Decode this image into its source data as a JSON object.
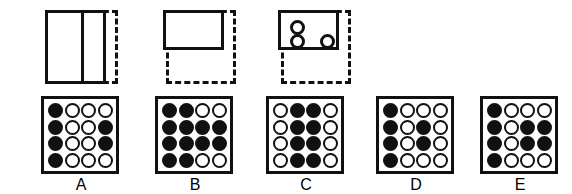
{
  "puzzle": {
    "type": "visual-analogy-matrix",
    "stimulus_count": 3,
    "option_count": 5
  },
  "stimuli": [
    {
      "id": "figure-1",
      "name": "divided-rectangle-with-dashed-frame",
      "description": "Tall solid rectangle split by a vertical line, overlapping a dashed square frame",
      "solid_shape": "rectangle-divided-vertically",
      "dashed_frame": "square",
      "circles": 0
    },
    {
      "id": "figure-2",
      "name": "top-rectangle-with-dashed-frame",
      "description": "Wide solid rectangle in the upper half of a dashed square frame",
      "solid_shape": "rectangle",
      "dashed_frame": "square",
      "circles": 0
    },
    {
      "id": "figure-3",
      "name": "rectangle-with-three-circles",
      "description": "Wide solid rectangle in the upper half of a dashed square frame containing three open circles",
      "solid_shape": "rectangle",
      "dashed_frame": "square",
      "circles": 3
    }
  ],
  "legend": {
    "filled": "filled",
    "open": "open"
  },
  "options": [
    {
      "label": "A",
      "name": "option-a",
      "grid": [
        [
          "filled",
          "open",
          "open",
          "open"
        ],
        [
          "filled",
          "open",
          "open",
          "filled"
        ],
        [
          "filled",
          "open",
          "open",
          "filled"
        ],
        [
          "filled",
          "open",
          "open",
          "open"
        ]
      ]
    },
    {
      "label": "B",
      "name": "option-b",
      "grid": [
        [
          "filled",
          "filled",
          "open",
          "open"
        ],
        [
          "filled",
          "filled",
          "filled",
          "filled"
        ],
        [
          "filled",
          "filled",
          "filled",
          "filled"
        ],
        [
          "filled",
          "filled",
          "open",
          "open"
        ]
      ]
    },
    {
      "label": "C",
      "name": "option-c",
      "grid": [
        [
          "open",
          "filled",
          "filled",
          "open"
        ],
        [
          "open",
          "filled",
          "filled",
          "open"
        ],
        [
          "open",
          "filled",
          "filled",
          "open"
        ],
        [
          "open",
          "filled",
          "filled",
          "open"
        ]
      ]
    },
    {
      "label": "D",
      "name": "option-d",
      "grid": [
        [
          "filled",
          "open",
          "open",
          "open"
        ],
        [
          "filled",
          "open",
          "filled",
          "open"
        ],
        [
          "filled",
          "open",
          "filled",
          "open"
        ],
        [
          "filled",
          "open",
          "open",
          "open"
        ]
      ]
    },
    {
      "label": "E",
      "name": "option-e",
      "grid": [
        [
          "filled",
          "open",
          "open",
          "open"
        ],
        [
          "filled",
          "open",
          "filled",
          "filled"
        ],
        [
          "filled",
          "open",
          "filled",
          "filled"
        ],
        [
          "filled",
          "open",
          "open",
          "open"
        ]
      ]
    }
  ],
  "colors": {
    "ink": "#111111",
    "paper": "#ffffff"
  }
}
